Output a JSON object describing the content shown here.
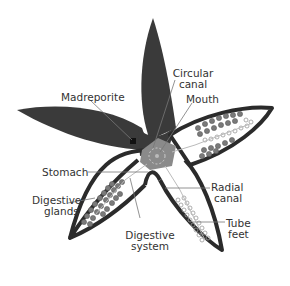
{
  "colors": {
    "aboral_fill": "#3a3a3a",
    "outline": "#2b2b2b",
    "center_fill": "#8a8a8a",
    "gland_fill": "#7a7a7a",
    "tube_feet": "#9a9a9a",
    "leader": "#777777"
  },
  "labels": {
    "madreporite": "Madreporite",
    "circular_canal_1": "Circular",
    "circular_canal_2": "canal",
    "mouth": "Mouth",
    "stomach": "Stomach",
    "digestive_glands_1": "Digestive",
    "digestive_glands_2": "glands",
    "radial_canal_1": "Radial",
    "radial_canal_2": "canal",
    "tube_feet_1": "Tube",
    "tube_feet_2": "feet",
    "digestive_system_1": "Digestive",
    "digestive_system_2": "system"
  }
}
